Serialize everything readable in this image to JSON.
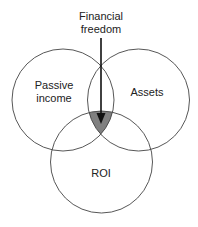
{
  "diagram": {
    "type": "venn",
    "title_line1": "Financial",
    "title_line2": "freedom",
    "sets": [
      {
        "label_line1": "Passive",
        "label_line2": "income"
      },
      {
        "label": "Assets"
      },
      {
        "label": "ROI"
      }
    ],
    "intersection_fill": "#808080",
    "stroke_color": "#444444"
  }
}
